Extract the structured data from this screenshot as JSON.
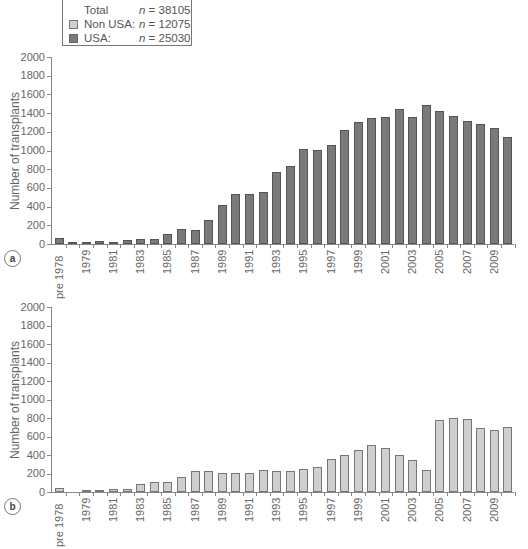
{
  "legend": {
    "rows": [
      {
        "label": "Total",
        "n_prefix": "n",
        "n_value": " = 38105",
        "swatch": null
      },
      {
        "label": "Non USA:",
        "n_prefix": "n",
        "n_value": " = 12075",
        "swatch": "#cfcfcf"
      },
      {
        "label": "USA:",
        "n_prefix": "n",
        "n_value": " = 25030",
        "swatch": "#7a7a7a"
      }
    ]
  },
  "panels": {
    "a": {
      "badge": "a",
      "ytitle": "Number of transplants"
    },
    "b": {
      "badge": "b",
      "ytitle": "Number of transplants"
    }
  },
  "chart_data": [
    {
      "type": "bar",
      "panel": "a",
      "title": "",
      "series": [
        {
          "name": "USA",
          "color": "#7a7a7a",
          "values": [
            64,
            21,
            18,
            28,
            18,
            46,
            53,
            53,
            111,
            164,
            153,
            253,
            415,
            535,
            535,
            553,
            767,
            834,
            1020,
            1002,
            1062,
            1216,
            1308,
            1344,
            1362,
            1444,
            1355,
            1487,
            1419,
            1369,
            1319,
            1280,
            1237,
            1141
          ]
        }
      ],
      "categories": [
        "pre 1978",
        "1978",
        "1979",
        "1980",
        "1981",
        "1982",
        "1983",
        "1984",
        "1985",
        "1986",
        "1987",
        "1988",
        "1989",
        "1990",
        "1991",
        "1992",
        "1993",
        "1994",
        "1995",
        "1996",
        "1997",
        "1998",
        "1999",
        "2000",
        "2001",
        "2002",
        "2003",
        "2004",
        "2005",
        "2006",
        "2007",
        "2008",
        "2009",
        "2010"
      ],
      "tick_labels": [
        "pre 1978",
        "",
        "1979",
        "",
        "1981",
        "",
        "1983",
        "",
        "1985",
        "",
        "1987",
        "",
        "1989",
        "",
        "1991",
        "",
        "1993",
        "",
        "1995",
        "",
        "1997",
        "",
        "1999",
        "",
        "2001",
        "",
        "2003",
        "",
        "2005",
        "",
        "2007",
        "",
        "2009",
        ""
      ],
      "xlabel": "",
      "ylabel": "Number of transplants",
      "yticks": [
        0,
        200,
        400,
        600,
        800,
        1000,
        1200,
        1400,
        1600,
        1800,
        2000
      ],
      "ylim": [
        0,
        2000
      ],
      "grid": false
    },
    {
      "type": "bar",
      "panel": "b",
      "title": "",
      "series": [
        {
          "name": "Non USA",
          "color": "#cfcfcf",
          "values": [
            43,
            0,
            22,
            25,
            36,
            36,
            83,
            112,
            112,
            160,
            223,
            228,
            210,
            208,
            202,
            238,
            222,
            222,
            245,
            270,
            362,
            395,
            455,
            505,
            478,
            398,
            350,
            235,
            775,
            800,
            785,
            688,
            665,
            700
          ]
        }
      ],
      "categories": [
        "pre 1978",
        "1978",
        "1979",
        "1980",
        "1981",
        "1982",
        "1983",
        "1984",
        "1985",
        "1986",
        "1987",
        "1988",
        "1989",
        "1990",
        "1991",
        "1992",
        "1993",
        "1994",
        "1995",
        "1996",
        "1997",
        "1998",
        "1999",
        "2000",
        "2001",
        "2002",
        "2003",
        "2004",
        "2005",
        "2006",
        "2007",
        "2008",
        "2009",
        "2010"
      ],
      "tick_labels": [
        "pre 1978",
        "",
        "1979",
        "",
        "1981",
        "",
        "1983",
        "",
        "1985",
        "",
        "1987",
        "",
        "1989",
        "",
        "1991",
        "",
        "1993",
        "",
        "1995",
        "",
        "1997",
        "",
        "1999",
        "",
        "2001",
        "",
        "2003",
        "",
        "2005",
        "",
        "2007",
        "",
        "2009",
        ""
      ],
      "xlabel": "",
      "ylabel": "Number of transplants",
      "yticks": [
        0,
        200,
        400,
        600,
        800,
        1000,
        1200,
        1400,
        1600,
        1800,
        2000
      ],
      "ylim": [
        0,
        2000
      ],
      "grid": false
    }
  ]
}
